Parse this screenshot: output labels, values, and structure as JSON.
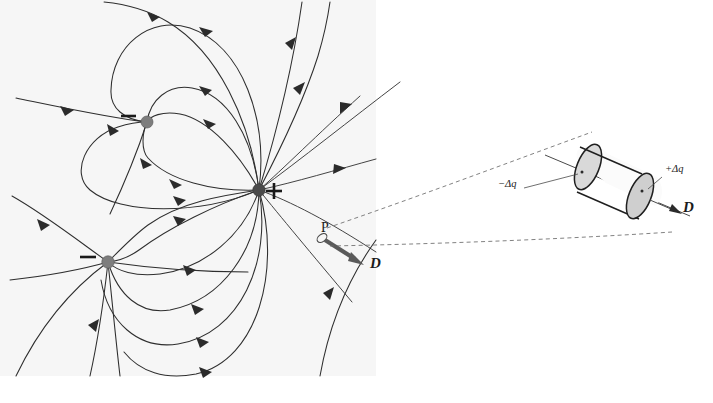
{
  "figure": {
    "background_color": "#ffffff",
    "panel_background_color": "#f6f6f6",
    "width": 713,
    "height": 403
  },
  "left_panel": {
    "name": "field-line-map",
    "description": "Electric field line map around one positive and two negative point charges",
    "charges": [
      {
        "id": "negative-upper",
        "sign_label": "−",
        "polarity": "negative",
        "x": 147,
        "y": 122,
        "radius": 6.0,
        "color": "#7d7d7d",
        "sign_offset_x": -19,
        "sign_offset_y": -6
      },
      {
        "id": "positive-center",
        "sign_label": "+",
        "polarity": "positive",
        "x": 259,
        "y": 190,
        "radius": 6.2,
        "color": "#4a4a4a",
        "sign_offset_x": 14,
        "sign_offset_y": 1
      },
      {
        "id": "negative-lower",
        "sign_label": "−",
        "polarity": "negative",
        "x": 108,
        "y": 262,
        "radius": 6.2,
        "color": "#7d7d7d",
        "sign_offset_x": -19,
        "sign_offset_y": -5
      }
    ],
    "point_marker": {
      "id": "point-P",
      "label": "P",
      "x": 322,
      "y": 238,
      "label_offset_x": 3,
      "label_offset_y": -6,
      "ellipse_rx": 5.5,
      "ellipse_ry": 3.6,
      "ellipse_rotation": -38
    },
    "field_vector": {
      "id": "D-vector-at-P",
      "label": "D",
      "label_x": 370,
      "label_y": 268,
      "start_x": 327,
      "start_y": 241,
      "end_x": 361,
      "end_y": 263,
      "color": "#5a5a5a"
    }
  },
  "right_panel": {
    "name": "flux-tube-detail",
    "description": "Magnified cylindrical Gaussian flux tube element cut from the field tube at P",
    "cylinder": {
      "id": "flux-tube-cylinder",
      "center_x": 614,
      "center_y": 180,
      "length": 78,
      "radius": 24,
      "tilt_degrees": 26
    },
    "labels": {
      "left_cap": "−Δq",
      "left_cap_x": 498,
      "left_cap_y": 187,
      "right_cap": "+Δq",
      "right_cap_x": 665,
      "right_cap_y": 172,
      "vector": "D",
      "vector_x": 683,
      "vector_y": 212
    },
    "leader_lines": {
      "upper_dashed": "from point P region up-right to top of cylinder",
      "lower_dashed": "from point P region right to bottom of cylinder"
    }
  },
  "colors": {
    "fieldline": "#2e2e2e",
    "arrowhead": "#2b2b2b",
    "negative_charge": "#7d7d7d",
    "positive_charge": "#4a4a4a",
    "dashed_leader": "#6b6b6b",
    "cylinder_edge": "#1f1f1f",
    "cylinder_cap_shade": "#d9d9d9",
    "vector_arrow": "#5a5a5a"
  }
}
